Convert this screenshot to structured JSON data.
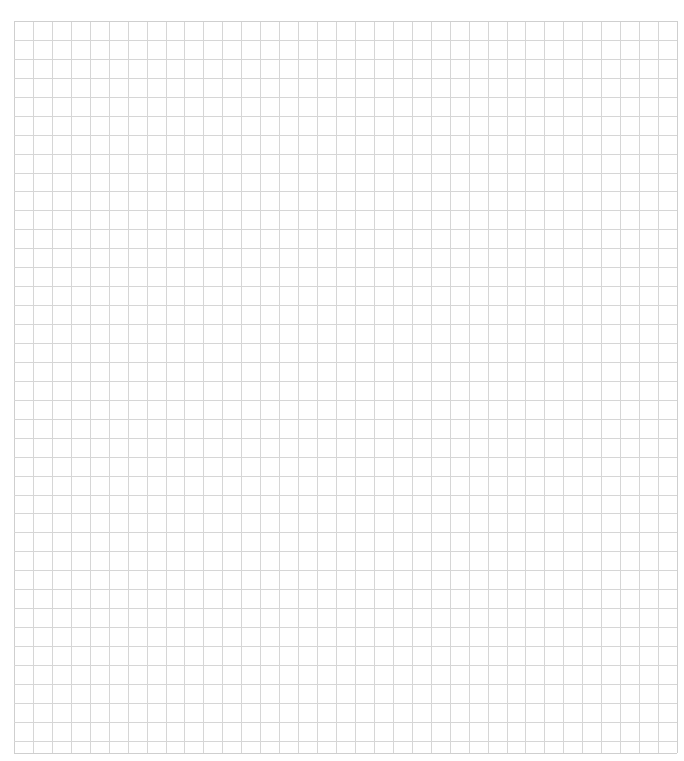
{
  "page": {
    "background_color": "#ffffff",
    "caption": ""
  },
  "grid": {
    "left": 14,
    "top": 21,
    "right": 677,
    "bottom": 753,
    "columns": 35,
    "cell_size": 18.94,
    "line_color": "#d6d6d6",
    "border_color": "#cfcfcf",
    "line_width": 1
  }
}
